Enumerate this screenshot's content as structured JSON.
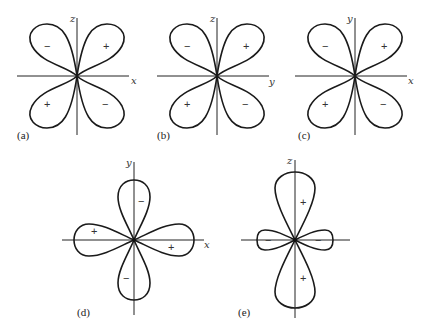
{
  "figure": {
    "panels": [
      {
        "id": "a",
        "caption": "(a)",
        "axis_h": "x",
        "axis_v": "z",
        "type": "four-leaf-diagonal",
        "lobes": [
          {
            "position": "upper-left",
            "sign": "−"
          },
          {
            "position": "upper-right",
            "sign": "+"
          },
          {
            "position": "lower-left",
            "sign": "+"
          },
          {
            "position": "lower-right",
            "sign": "−"
          }
        ]
      },
      {
        "id": "b",
        "caption": "(b)",
        "axis_h": "y",
        "axis_v": "z",
        "type": "four-leaf-diagonal",
        "lobes": [
          {
            "position": "upper-left",
            "sign": "−"
          },
          {
            "position": "upper-right",
            "sign": "+"
          },
          {
            "position": "lower-left",
            "sign": "+"
          },
          {
            "position": "lower-right",
            "sign": "−"
          }
        ]
      },
      {
        "id": "c",
        "caption": "(c)",
        "axis_h": "x",
        "axis_v": "y",
        "type": "four-leaf-diagonal",
        "lobes": [
          {
            "position": "upper-left",
            "sign": "−"
          },
          {
            "position": "upper-right",
            "sign": "+"
          },
          {
            "position": "lower-left",
            "sign": "+"
          },
          {
            "position": "lower-right",
            "sign": "−"
          }
        ]
      },
      {
        "id": "d",
        "caption": "(d)",
        "axis_h": "x",
        "axis_v": "y",
        "type": "four-leaf-on-axes",
        "lobes": [
          {
            "position": "top",
            "sign": "−"
          },
          {
            "position": "bottom",
            "sign": "−"
          },
          {
            "position": "left",
            "sign": "+"
          },
          {
            "position": "right",
            "sign": "+"
          }
        ]
      },
      {
        "id": "e",
        "caption": "(e)",
        "axis_v": "z",
        "type": "dumbbell-with-torus",
        "lobes": [
          {
            "position": "top",
            "sign": "+"
          },
          {
            "position": "bottom",
            "sign": "+"
          },
          {
            "position": "left",
            "sign": "−"
          },
          {
            "position": "right",
            "sign": "−"
          }
        ]
      }
    ]
  }
}
